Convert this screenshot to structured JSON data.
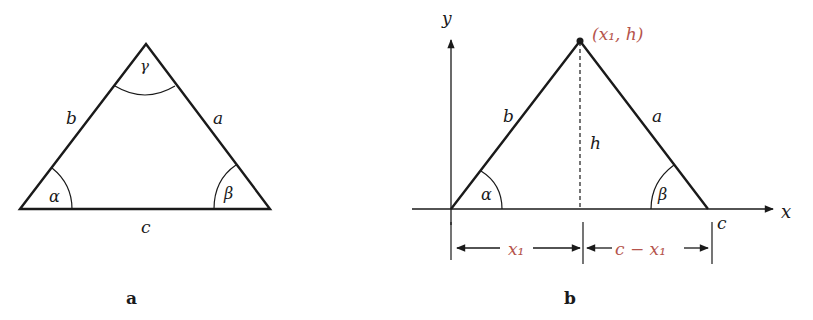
{
  "figure_a": {
    "caption": "a",
    "sides": {
      "a": "a",
      "b": "b",
      "c": "c"
    },
    "angles": {
      "alpha": "α",
      "beta": "β",
      "gamma": "γ"
    }
  },
  "figure_b": {
    "caption": "b",
    "axes": {
      "x": "x",
      "y": "y"
    },
    "apex_label": "(x₁, h)",
    "sides": {
      "a": "a",
      "b": "b",
      "c": "c"
    },
    "height_label": "h",
    "angles": {
      "alpha": "α",
      "beta": "β"
    },
    "dimensions": {
      "left": "x₁",
      "right": "c − x₁"
    }
  },
  "colors": {
    "ink": "#1a1a1a",
    "accent": "#b5544c"
  }
}
